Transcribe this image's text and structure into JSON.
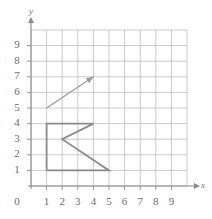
{
  "figure": {
    "axis_x_label": "x",
    "axis_y_label": "y",
    "origin_label": "0"
  },
  "chart_data": {
    "type": "scatter",
    "title": "",
    "xlabel": "x",
    "ylabel": "y",
    "xlim": [
      0,
      10
    ],
    "ylim": [
      0,
      10
    ],
    "grid": true,
    "legend": false,
    "x_tick_labels": [
      "1",
      "2",
      "3",
      "4",
      "5",
      "6",
      "7",
      "8",
      "9"
    ],
    "x_tick_values": [
      1,
      2,
      3,
      4,
      5,
      6,
      7,
      8,
      9
    ],
    "y_tick_labels": [
      "1",
      "2",
      "3",
      "4",
      "5",
      "6",
      "7",
      "8",
      "9"
    ],
    "y_tick_values": [
      1,
      2,
      3,
      4,
      5,
      6,
      7,
      8,
      9
    ],
    "origin_tick_label": "0",
    "shapes": [
      {
        "name": "k-polyline",
        "kind": "polyline",
        "closed": false,
        "color": "#8c8c8c",
        "points": [
          [
            1,
            1
          ],
          [
            1,
            4
          ],
          [
            4,
            4
          ],
          [
            2,
            3
          ],
          [
            5,
            1
          ],
          [
            1,
            1
          ]
        ],
        "description": "Letter K outline drawn on the grid"
      },
      {
        "name": "vector-arrow",
        "kind": "arrow",
        "color": "#9a9a9a",
        "start": [
          1,
          5
        ],
        "end": [
          4,
          7
        ],
        "description": "Translation vector arrow from (1,5) to (4,7)"
      }
    ]
  },
  "colors": {
    "grid_line": "#b9bcc4",
    "axis_line": "#8a8a8a",
    "shape_stroke": "#8c8c8c",
    "arrow_stroke": "#9a9a9a",
    "tick_text": "#6b6b6b",
    "background": "#ffffff"
  }
}
